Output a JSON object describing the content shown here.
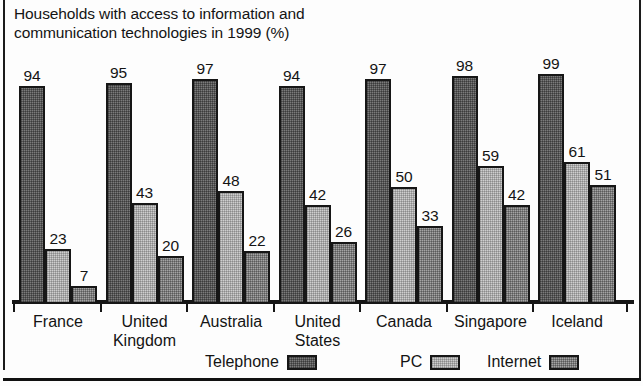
{
  "chart_data": {
    "type": "bar",
    "title": "Households with access to information and communication technologies in 1999 (%)",
    "title_lines": [
      "Households with access to information and",
      "communication technologies in 1999 (%)"
    ],
    "xlabel": "",
    "ylabel": "",
    "ylim": [
      0,
      100
    ],
    "grid": false,
    "legend_position": "bottom",
    "categories": [
      "France",
      "United Kingdom",
      "Australia",
      "United States",
      "Canada",
      "Singapore",
      "Iceland"
    ],
    "category_lines": [
      [
        "France"
      ],
      [
        "United",
        "Kingdom"
      ],
      [
        "Australia"
      ],
      [
        "United",
        "States"
      ],
      [
        "Canada"
      ],
      [
        "Singapore"
      ],
      [
        "Iceland"
      ]
    ],
    "series": [
      {
        "name": "Telephone",
        "color": "#7b7b7b",
        "values": [
          94,
          95,
          97,
          94,
          97,
          98,
          99
        ]
      },
      {
        "name": "PC",
        "color": "#cecece",
        "values": [
          23,
          43,
          48,
          42,
          50,
          59,
          61
        ]
      },
      {
        "name": "Internet",
        "color": "#a4a4a4",
        "values": [
          7,
          20,
          22,
          26,
          33,
          42,
          51
        ]
      }
    ]
  },
  "legend": {
    "items": [
      {
        "label": "Telephone",
        "key": "telephone"
      },
      {
        "label": "PC",
        "key": "pc"
      },
      {
        "label": "Internet",
        "key": "internet"
      }
    ]
  },
  "style": {
    "axis_color": "#161616",
    "text_color": "#141414",
    "background": "#fdfdfd"
  }
}
